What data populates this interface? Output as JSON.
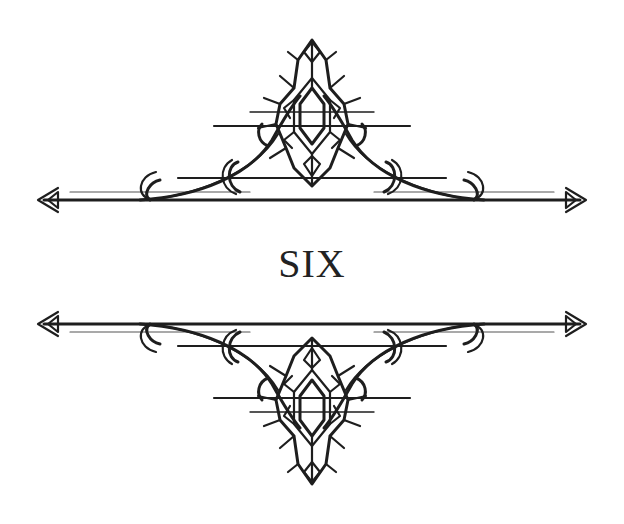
{
  "chapter": {
    "title": "SIX"
  },
  "ornaments": {
    "top": {
      "icon": "gothic-crest-divider-icon",
      "orientation": "up"
    },
    "bottom": {
      "icon": "gothic-crest-divider-icon",
      "orientation": "down"
    }
  },
  "colors": {
    "ink": "#1e1e1e",
    "background": "#ffffff",
    "title": "#222222"
  }
}
